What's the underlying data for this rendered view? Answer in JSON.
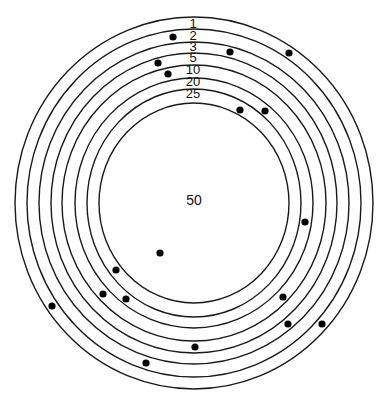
{
  "diagram": {
    "type": "concentric-rings",
    "center": {
      "x": 194,
      "y": 203
    },
    "colors": {
      "stroke": "#1a1a1a",
      "dot": "#000000",
      "background": "#ffffff"
    },
    "rings": [
      {
        "label": "1",
        "rx": 179,
        "ry": 186,
        "label_y": 28
      },
      {
        "label": "2",
        "rx": 167,
        "ry": 174,
        "label_y": 40
      },
      {
        "label": "3",
        "rx": 155,
        "ry": 161,
        "label_y": 51
      },
      {
        "label": "5",
        "rx": 143,
        "ry": 150,
        "label_y": 62
      },
      {
        "label": "10",
        "rx": 132,
        "ry": 138,
        "label_y": 74
      },
      {
        "label": "20",
        "rx": 119,
        "ry": 125,
        "label_y": 86
      },
      {
        "label": "25",
        "rx": 107,
        "ry": 114,
        "label_y": 98
      },
      {
        "label": "",
        "rx": 95,
        "ry": 100,
        "label_y": 0
      }
    ],
    "center_label": "50",
    "dots": [
      {
        "x": 173,
        "y": 37
      },
      {
        "x": 230,
        "y": 52
      },
      {
        "x": 289,
        "y": 53
      },
      {
        "x": 158,
        "y": 63
      },
      {
        "x": 168,
        "y": 74
      },
      {
        "x": 240,
        "y": 110
      },
      {
        "x": 265,
        "y": 111
      },
      {
        "x": 305,
        "y": 222
      },
      {
        "x": 160,
        "y": 253
      },
      {
        "x": 116,
        "y": 270
      },
      {
        "x": 103,
        "y": 294
      },
      {
        "x": 126,
        "y": 299
      },
      {
        "x": 283,
        "y": 297
      },
      {
        "x": 52,
        "y": 306
      },
      {
        "x": 288,
        "y": 324
      },
      {
        "x": 322,
        "y": 324
      },
      {
        "x": 195,
        "y": 347
      },
      {
        "x": 146,
        "y": 363
      }
    ]
  }
}
